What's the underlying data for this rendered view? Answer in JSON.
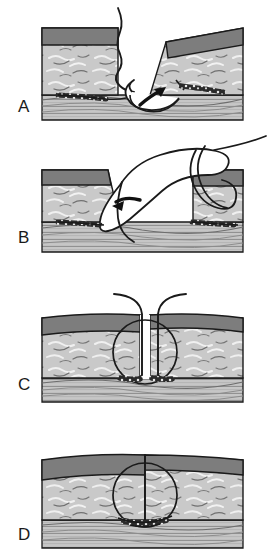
{
  "figure": {
    "panel_count": 4,
    "background_color": "#ffffff",
    "width": 278,
    "height": 559
  },
  "colors": {
    "epidermis": "#7d7d7d",
    "epidermis_dark_edge": "#5e5e5e",
    "dermis": "#c9c9c9",
    "dermis_fiber_light": "#efefef",
    "dermis_fiber_dark": "#6f6f6f",
    "subcutaneous": "#c4c4c4",
    "subcutaneous_line": "#8a8a8a",
    "outline": "#1a1a1a",
    "suture_thread": "#1a1a1a",
    "needle_body": "#ffffff",
    "needle_outline": "#1a1a1a",
    "arrow": "#111111",
    "label_text": "#1a1a1a"
  },
  "panels": [
    {
      "id": "A",
      "label": "A",
      "label_x": 18,
      "label_y": 112,
      "caption": "Needle enters dermis of everted wound edge from deep to superficial",
      "has_needle": true,
      "has_arrow": true,
      "arrow_direction": "up-right",
      "has_thread_tail": true,
      "wound_open": true,
      "suture_loop": false,
      "tissue_bites": 1
    },
    {
      "id": "B",
      "label": "B",
      "label_x": 18,
      "label_y": 243,
      "caption": "Needle passes through opposite wound edge, thread loops across defect",
      "has_needle": true,
      "has_arrow": true,
      "arrow_direction": "down-left",
      "has_thread_tail": true,
      "wound_open": true,
      "suture_loop": true,
      "tissue_bites": 2
    },
    {
      "id": "C",
      "label": "C",
      "label_x": 18,
      "label_y": 390,
      "caption": "Both suture ends exit the wound; buried loop spans the dermis",
      "has_needle": false,
      "has_arrow": false,
      "has_thread_tail": true,
      "wound_open": true,
      "suture_loop": true,
      "loop_circle": true,
      "tissue_bites": 2
    },
    {
      "id": "D",
      "label": "D",
      "label_x": 18,
      "label_y": 540,
      "caption": "Suture tied and tightened; wound edges approximated and everted",
      "has_needle": false,
      "has_arrow": false,
      "has_thread_tail": false,
      "wound_open": false,
      "suture_loop": true,
      "loop_circle": true,
      "tissue_bites": 1
    }
  ],
  "tissue_layers": [
    {
      "name": "epidermis",
      "order": 1,
      "description": "dark gray superficial band"
    },
    {
      "name": "dermis",
      "order": 2,
      "description": "light gray layer with collagen fiber strokes"
    },
    {
      "name": "subcutaneous",
      "order": 3,
      "description": "striated horizontal fatty layer"
    }
  ]
}
